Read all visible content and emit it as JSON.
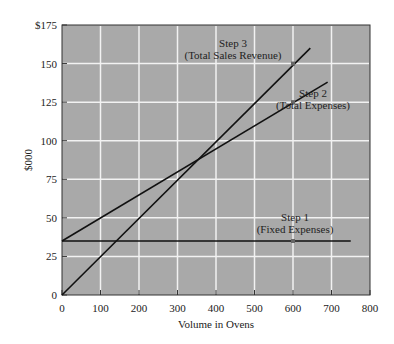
{
  "chart_data": {
    "type": "line",
    "title": "",
    "xlabel": "Volume in Ovens",
    "ylabel": "$000",
    "xlim": [
      0,
      800
    ],
    "ylim": [
      0,
      175
    ],
    "grid": true,
    "x_ticks": [
      "0",
      "100",
      "200",
      "300",
      "400",
      "500",
      "600",
      "700",
      "800"
    ],
    "y_ticks": [
      "0",
      "25",
      "50",
      "75",
      "100",
      "125",
      "150",
      "$175"
    ],
    "series": [
      {
        "name": "Step 1 (Fixed Expenses)",
        "x": [
          0,
          750
        ],
        "values": [
          35,
          35
        ]
      },
      {
        "name": "Step 2 (Total Expenses)",
        "x": [
          0,
          690
        ],
        "values": [
          35,
          138
        ]
      },
      {
        "name": "Step 3 (Total Sales Revenue)",
        "x": [
          0,
          645
        ],
        "values": [
          0,
          160
        ]
      }
    ],
    "annotations": [
      {
        "line1": "Step 1",
        "line2": "(Fixed Expenses)",
        "x": 600,
        "y": 35
      },
      {
        "line1": "Step 2",
        "line2": "(Total Expenses)",
        "x": 600,
        "y": 125
      },
      {
        "line1": "Step 3",
        "line2": "(Total Sales Revenue)",
        "x": 600,
        "y": 150
      }
    ],
    "colors": {
      "plot_bg": "#a9a9a9",
      "grid": "#f2f2f2",
      "line": "#111111"
    }
  }
}
